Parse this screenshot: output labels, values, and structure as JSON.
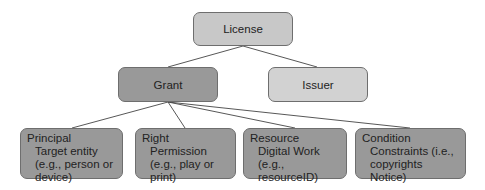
{
  "diagram": {
    "root": {
      "label": "License"
    },
    "level2": [
      {
        "label": "Grant"
      },
      {
        "label": "Issuer"
      }
    ],
    "leaves": [
      {
        "title": "Principal",
        "desc": "Target entity (e.g., person or device)"
      },
      {
        "title": "Right",
        "desc": "Permission (e.g., play or print)"
      },
      {
        "title": "Resource",
        "desc": "Digital Work (e.g., resourceID)"
      },
      {
        "title": "Condition",
        "desc": "Constraints (i.e., copyrights Notice)"
      }
    ],
    "edges": [
      [
        "License",
        "Grant"
      ],
      [
        "License",
        "Issuer"
      ],
      [
        "Grant",
        "Principal"
      ],
      [
        "Grant",
        "Right"
      ],
      [
        "Grant",
        "Resource"
      ],
      [
        "Grant",
        "Condition"
      ]
    ],
    "colors": {
      "license_fill": "#c8c8c8",
      "grant_fill": "#999999",
      "issuer_fill": "#d2d2d2",
      "leaf_fill": "#999999",
      "border": "#6e6e6e",
      "line": "#444444"
    }
  }
}
